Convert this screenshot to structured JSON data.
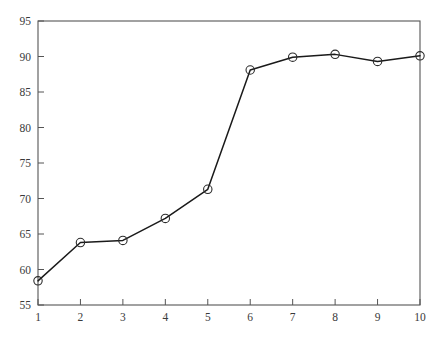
{
  "chart_data": {
    "type": "line",
    "title": "",
    "subtitle": "",
    "xlabel": "",
    "ylabel": "",
    "x": [
      1,
      2,
      3,
      4,
      5,
      6,
      7,
      8,
      9,
      10
    ],
    "values": [
      58.4,
      63.8,
      64.1,
      67.2,
      71.3,
      88.1,
      89.9,
      90.3,
      89.3,
      90.1
    ],
    "series": [
      {
        "name": "series-1",
        "values": [
          58.4,
          63.8,
          64.1,
          67.2,
          71.3,
          88.1,
          89.9,
          90.3,
          89.3,
          90.1
        ],
        "marker": "circle",
        "color": "#1a1a1a"
      }
    ],
    "xticks": [
      "1",
      "2",
      "3",
      "4",
      "5",
      "6",
      "7",
      "8",
      "9",
      "10"
    ],
    "yticks": [
      "55",
      "60",
      "65",
      "70",
      "75",
      "80",
      "85",
      "90",
      "95"
    ],
    "xlim": [
      1,
      10
    ],
    "ylim": [
      55,
      95
    ],
    "grid": false,
    "legend": false,
    "legend_position": "none",
    "annotations": [],
    "axis_color": "#555555",
    "line_color": "#1a1a1a",
    "marker_color": "#2b2b2b",
    "background_color": "#ffffff",
    "point_labels": [
      "x=1, y=58.4",
      "x=2, y=63.8",
      "x=3, y=64.1",
      "x=4, y=67.2",
      "x=5, y=71.3",
      "x=6, y=88.1",
      "x=7, y=89.9",
      "x=8, y=90.3",
      "x=9, y=89.3",
      "x=10, y=90.1"
    ]
  },
  "layout": {
    "plot_left": 38,
    "plot_right": 420,
    "plot_top": 21,
    "plot_bottom": 305,
    "canvas_width": 445,
    "canvas_height": 345
  }
}
